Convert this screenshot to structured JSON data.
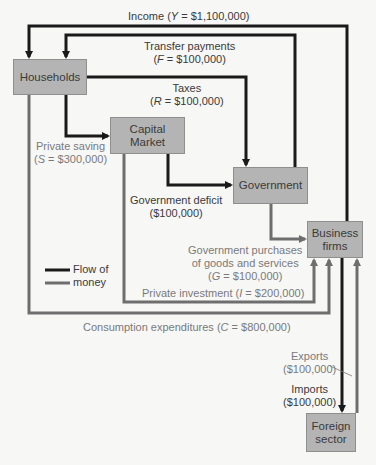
{
  "diagram": {
    "type": "circular-flow",
    "nodes": {
      "households": "Households",
      "capital_market": [
        "Capital",
        "Market"
      ],
      "government": "Government",
      "business_firms": [
        "Business",
        "firms"
      ],
      "foreign_sector": [
        "Foreign",
        "sector"
      ]
    },
    "flows": {
      "income": {
        "text": "Income",
        "var": "Y",
        "value": "$1,100,000"
      },
      "transfer": {
        "text": "Transfer payments",
        "var": "F",
        "value": "$100,000"
      },
      "taxes": {
        "text": "Taxes",
        "var": "R",
        "value": "$100,000"
      },
      "saving": {
        "text": "Private saving",
        "var": "S",
        "value": "$300,000"
      },
      "deficit": {
        "text": "Government deficit",
        "value": "($100,000)"
      },
      "purchases": {
        "line1": "Government purchases",
        "line2": "of goods and services",
        "var": "G",
        "value": "$100,000"
      },
      "investment": {
        "text": "Private investment",
        "var": "I",
        "value": "$200,000"
      },
      "consumption": {
        "text": "Consumption expenditures",
        "var": "C",
        "value": "$800,000"
      },
      "exports": {
        "text": "Exports",
        "value": "($100,000)"
      },
      "imports": {
        "text": "Imports",
        "value": "($100,000)"
      }
    },
    "legend": {
      "line1": "Flow of",
      "line2": "money"
    },
    "colors": {
      "black_flow": "#1a1a1a",
      "gray_flow": "#6e6e6e",
      "box_fill": "#b4b4b4",
      "background": "#f7f7f6"
    }
  }
}
